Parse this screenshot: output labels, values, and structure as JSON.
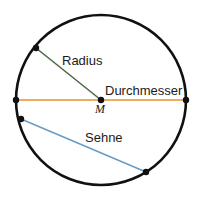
{
  "figure": {
    "background_color": "#ffffff",
    "width": 204,
    "height": 201
  },
  "circle": {
    "name": "circle-outline",
    "center_x": 101,
    "center_y": 100,
    "radius": 85,
    "stroke_color": "#111111",
    "stroke_width": 2.6,
    "fill": "none"
  },
  "center_point": {
    "label": "M",
    "x": 101,
    "y": 100,
    "marker_color": "#111111",
    "marker_radius": 3.2
  },
  "segments": [
    {
      "id": "radius",
      "label": "Radius",
      "color": "#4a6b46",
      "stroke_width": 1.6,
      "x1": 101,
      "y1": 100,
      "x2": 36,
      "y2": 48,
      "label_x": 62,
      "label_y": 54
    },
    {
      "id": "durchmesser",
      "label": "Durchmesser",
      "color": "#e8922a",
      "stroke_width": 1.6,
      "x1": 16,
      "y1": 100,
      "x2": 186,
      "y2": 100,
      "label_x": 105,
      "label_y": 84
    },
    {
      "id": "sehne",
      "label": "Sehne",
      "color": "#6b9bc3",
      "stroke_width": 1.6,
      "x1": 21,
      "y1": 119,
      "x2": 146,
      "y2": 172,
      "label_x": 85,
      "label_y": 131
    }
  ],
  "endpoint_markers": [
    {
      "id": "radius-endpoint",
      "x": 36,
      "y": 48,
      "r": 3.2,
      "color": "#111111"
    },
    {
      "id": "diameter-left-endpoint",
      "x": 16,
      "y": 100,
      "r": 3.2,
      "color": "#111111"
    },
    {
      "id": "diameter-right-endpoint",
      "x": 186,
      "y": 100,
      "r": 3.2,
      "color": "#111111"
    },
    {
      "id": "chord-left-endpoint",
      "x": 21,
      "y": 119,
      "r": 3.2,
      "color": "#111111"
    },
    {
      "id": "chord-right-endpoint",
      "x": 146,
      "y": 172,
      "r": 3.2,
      "color": "#111111"
    }
  ],
  "labels": {
    "radius": "Radius",
    "durchmesser": "Durchmesser",
    "sehne": "Sehne",
    "center": "M"
  }
}
